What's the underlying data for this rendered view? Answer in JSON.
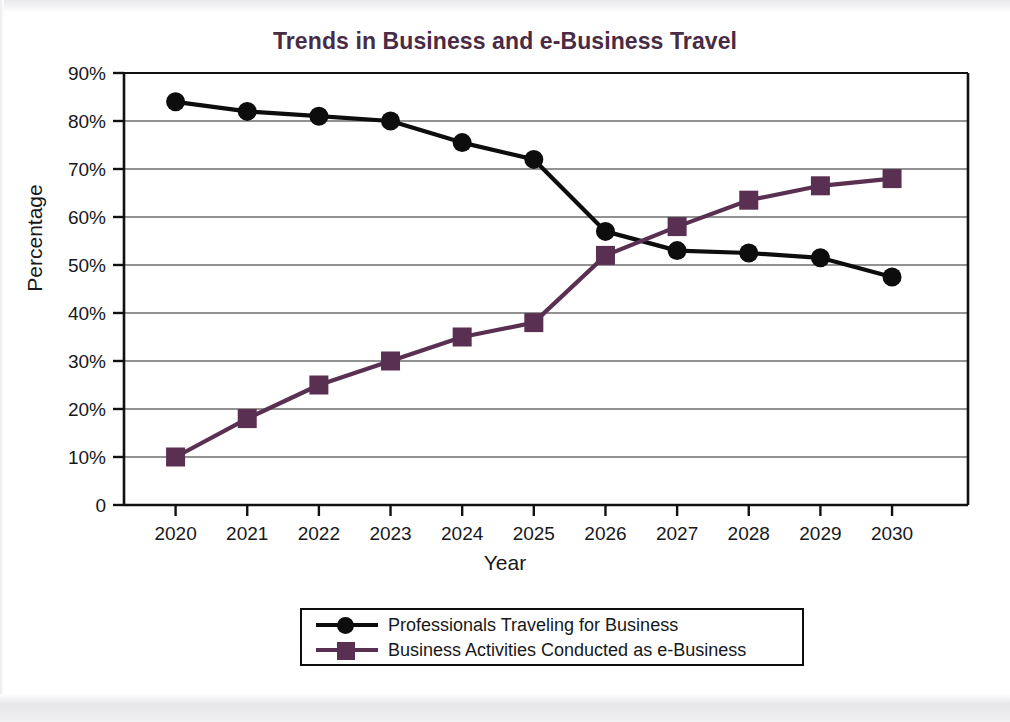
{
  "chart_data": {
    "type": "line",
    "title": "Trends in Business and e-Business Travel",
    "xlabel": "Year",
    "ylabel": "Percentage",
    "categories": [
      "2020",
      "2021",
      "2022",
      "2023",
      "2024",
      "2025",
      "2026",
      "2027",
      "2028",
      "2029",
      "2030"
    ],
    "ylim": [
      0,
      90
    ],
    "ytick_labels": [
      "0",
      "10%",
      "20%",
      "30%",
      "40%",
      "50%",
      "60%",
      "70%",
      "80%",
      "90%"
    ],
    "ytick_values": [
      0,
      10,
      20,
      30,
      40,
      50,
      60,
      70,
      80,
      90
    ],
    "grid": "horizontal",
    "legend_position": "bottom",
    "series": [
      {
        "name": "Professionals Traveling for Business",
        "color": "#0d0d0d",
        "marker": "circle",
        "values": [
          84,
          82,
          81,
          80,
          75.5,
          72,
          57,
          53,
          52.5,
          51.5,
          47.5
        ]
      },
      {
        "name": "Business Activities Conducted as e-Business",
        "color": "#59305180",
        "marker": "square",
        "values": [
          10,
          18,
          25,
          30,
          35,
          38,
          52,
          58,
          63.5,
          66.5,
          68
        ]
      }
    ]
  },
  "colors": {
    "title": "#4a2b45",
    "series_black": "#0d0d0d",
    "series_purple": "#593051",
    "axis": "#111111",
    "grid": "#6e6e6e"
  },
  "legend": {
    "entries": [
      {
        "label": "Professionals Traveling for Business"
      },
      {
        "label": "Business Activities Conducted as e-Business"
      }
    ]
  }
}
